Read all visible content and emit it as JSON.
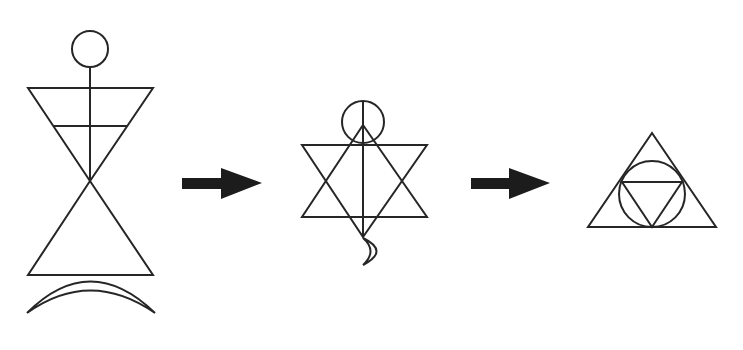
{
  "diagram": {
    "type": "symbol-transformation-sequence",
    "stroke_color": "#262626",
    "arrow_color": "#1c1c1c",
    "background": "#ffffff",
    "figures": [
      {
        "id": "figure-1",
        "description": "Hourglass human figure: circle head, vertical spine, inverted top triangle with horizontal crossbar, upright bottom triangle, crescent base",
        "elements": [
          "circle-head",
          "spine-line",
          "inverted-triangle",
          "crossbar",
          "upright-triangle",
          "crescent-base"
        ]
      },
      {
        "id": "figure-2",
        "description": "Hexagram (six-pointed star) with circle at top, vertical line through center, small crescent moon at bottom",
        "elements": [
          "circle-head",
          "vertical-axis",
          "upward-triangle",
          "downward-triangle",
          "crescent-moon"
        ]
      },
      {
        "id": "figure-3",
        "description": "Triangle with inscribed circle containing an inverted triangle",
        "elements": [
          "outer-triangle",
          "inscribed-circle",
          "inner-inverted-triangle"
        ]
      }
    ],
    "arrows": [
      {
        "id": "arrow-1",
        "direction": "right",
        "from": "figure-1",
        "to": "figure-2"
      },
      {
        "id": "arrow-2",
        "direction": "right",
        "from": "figure-2",
        "to": "figure-3"
      }
    ]
  }
}
